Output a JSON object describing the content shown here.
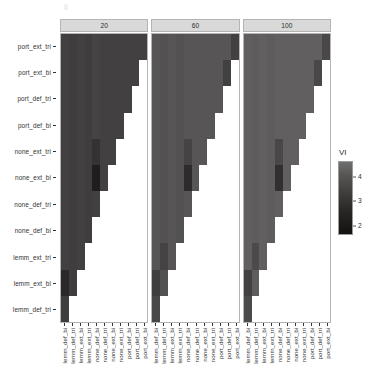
{
  "chart_data": {
    "type": "heatmap",
    "title": "",
    "xlabel": "",
    "ylabel": "",
    "facet_variable": "corpus size",
    "facets": [
      "20",
      "60",
      "100"
    ],
    "legend": {
      "title": "VI",
      "position": "right",
      "ticks": [
        "4",
        "3",
        "2"
      ],
      "tick_values": [
        4,
        3,
        2
      ],
      "scale_min": 1.6,
      "scale_max": 4.6,
      "low_color": "#132b43",
      "high_color": "#d9d9d9",
      "gradient_css": "linear-gradient(to bottom, #6f6f6f 0%, #5a5555 18%, #433e3e 42%, #2a2626 68%, #141111 100%)"
    },
    "y_categories": [
      "port_ext_tri",
      "port_ext_bi",
      "port_def_tri",
      "port_def_bi",
      "none_ext_tri",
      "none_ext_bi",
      "none_def_tri",
      "none_def_bi",
      "lemm_ext_tri",
      "lemm_ext_bi",
      "lemm_def_tri"
    ],
    "x_categories": [
      "lemm_def_bi",
      "lemm_def_tri",
      "lemm_ext_bi",
      "lemm_ext_tri",
      "none_def_bi",
      "none_def_tri",
      "none_ext_bi",
      "none_ext_tri",
      "port_def_bi",
      "port_def_tri",
      "port_ext_bi"
    ],
    "note": "Lower-left triangular matrix; blank (white) cells are NA. Values are VI (variation of information) distances.",
    "panels": [
      {
        "facet": "20",
        "values": [
          [
            3.1,
            3.0,
            3.1,
            3.0,
            3.2,
            3.1,
            3.1,
            3.1,
            3.1,
            3.1,
            3.1
          ],
          [
            3.1,
            3.0,
            3.1,
            3.0,
            3.2,
            3.1,
            3.1,
            3.1,
            3.1,
            3.1,
            null
          ],
          [
            3.1,
            3.0,
            3.1,
            3.0,
            3.2,
            3.1,
            3.1,
            3.1,
            3.1,
            null,
            null
          ],
          [
            3.1,
            3.0,
            3.1,
            3.0,
            3.2,
            3.1,
            3.1,
            3.1,
            null,
            null,
            null
          ],
          [
            3.1,
            3.0,
            3.1,
            3.0,
            2.7,
            3.1,
            3.1,
            null,
            null,
            null,
            null
          ],
          [
            3.1,
            3.0,
            3.1,
            3.0,
            2.1,
            3.1,
            null,
            null,
            null,
            null,
            null
          ],
          [
            3.1,
            3.0,
            3.1,
            3.0,
            3.1,
            null,
            null,
            null,
            null,
            null,
            null
          ],
          [
            3.1,
            3.0,
            3.1,
            3.0,
            null,
            null,
            null,
            null,
            null,
            null,
            null
          ],
          [
            3.1,
            3.0,
            3.1,
            null,
            null,
            null,
            null,
            null,
            null,
            null,
            null
          ],
          [
            2.4,
            3.0,
            null,
            null,
            null,
            null,
            null,
            null,
            null,
            null,
            null
          ],
          [
            3.0,
            null,
            null,
            null,
            null,
            null,
            null,
            null,
            null,
            null,
            null
          ]
        ]
      },
      {
        "facet": "60",
        "values": [
          [
            3.7,
            3.6,
            3.7,
            3.6,
            3.7,
            3.7,
            3.7,
            3.7,
            3.7,
            3.7,
            3.1
          ],
          [
            3.7,
            3.6,
            3.7,
            3.6,
            3.7,
            3.7,
            3.7,
            3.7,
            3.7,
            3.1,
            null
          ],
          [
            3.7,
            3.6,
            3.7,
            3.6,
            3.7,
            3.7,
            3.7,
            3.7,
            3.7,
            null,
            null
          ],
          [
            3.7,
            3.6,
            3.7,
            3.6,
            3.7,
            3.7,
            3.7,
            3.7,
            null,
            null,
            null
          ],
          [
            3.7,
            3.6,
            3.7,
            3.6,
            3.2,
            3.7,
            3.7,
            null,
            null,
            null,
            null
          ],
          [
            3.7,
            3.6,
            3.7,
            3.6,
            2.5,
            3.7,
            null,
            null,
            null,
            null,
            null
          ],
          [
            3.7,
            3.6,
            3.7,
            3.6,
            3.7,
            null,
            null,
            null,
            null,
            null,
            null
          ],
          [
            3.7,
            3.6,
            3.7,
            3.6,
            null,
            null,
            null,
            null,
            null,
            null,
            null
          ],
          [
            3.7,
            3.2,
            3.7,
            null,
            null,
            null,
            null,
            null,
            null,
            null,
            null
          ],
          [
            3.0,
            3.6,
            null,
            null,
            null,
            null,
            null,
            null,
            null,
            null,
            null
          ],
          [
            3.3,
            null,
            null,
            null,
            null,
            null,
            null,
            null,
            null,
            null,
            null
          ]
        ]
      },
      {
        "facet": "100",
        "values": [
          [
            4.0,
            3.9,
            4.0,
            3.9,
            4.0,
            4.0,
            4.0,
            4.0,
            4.0,
            4.0,
            3.3
          ],
          [
            4.0,
            3.9,
            4.0,
            3.9,
            4.0,
            4.0,
            4.0,
            4.0,
            4.0,
            3.3,
            null
          ],
          [
            4.0,
            3.9,
            4.0,
            3.9,
            4.0,
            4.0,
            4.0,
            4.0,
            4.0,
            null,
            null
          ],
          [
            4.0,
            3.9,
            4.0,
            3.9,
            4.0,
            4.0,
            4.0,
            4.0,
            null,
            null,
            null
          ],
          [
            4.0,
            3.9,
            4.0,
            3.9,
            3.3,
            4.0,
            4.0,
            null,
            null,
            null,
            null
          ],
          [
            4.0,
            3.9,
            4.0,
            3.9,
            2.6,
            4.0,
            null,
            null,
            null,
            null,
            null
          ],
          [
            4.0,
            3.9,
            4.0,
            3.9,
            4.0,
            null,
            null,
            null,
            null,
            null,
            null
          ],
          [
            4.0,
            3.9,
            4.0,
            3.9,
            null,
            null,
            null,
            null,
            null,
            null,
            null
          ],
          [
            4.0,
            3.4,
            4.0,
            null,
            null,
            null,
            null,
            null,
            null,
            null,
            null
          ],
          [
            3.1,
            3.9,
            null,
            null,
            null,
            null,
            null,
            null,
            null,
            null,
            null
          ],
          [
            3.4,
            null,
            null,
            null,
            null,
            null,
            null,
            null,
            null,
            null,
            null
          ]
        ]
      }
    ]
  }
}
